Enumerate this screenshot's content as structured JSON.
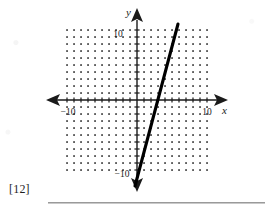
{
  "page": {
    "question_number": "[12]",
    "background_color": "#ffffff"
  },
  "figure": {
    "name": "coordinate-grid-line-graph",
    "axis_color": "#1a1a1a",
    "grid_dot_color": "#3a3a3a",
    "line_color": "#000000",
    "x_axis_label": "x",
    "y_axis_label": "y",
    "x_tick_left_label": "−10",
    "x_tick_right_label": "10",
    "y_tick_top_label": "10",
    "y_tick_bottom_label": "−10"
  },
  "chart_data": {
    "type": "line",
    "title": "",
    "xlabel": "x",
    "ylabel": "y",
    "xlim": [
      -10,
      10
    ],
    "ylim": [
      -10,
      10
    ],
    "grid": "dotted",
    "grid_step": 1,
    "legend_position": "none",
    "axis_tick_labels": {
      "x": [
        "-10",
        "10"
      ],
      "y": [
        "10",
        "-10"
      ]
    },
    "series": [
      {
        "name": "plotted-line",
        "slope": 4,
        "intercept": -2,
        "points": [
          {
            "x": -2,
            "y": -10
          },
          {
            "x": 0,
            "y": -2
          },
          {
            "x": 0.5,
            "y": 0
          },
          {
            "x": 3,
            "y": 10
          }
        ]
      }
    ],
    "annotations": []
  }
}
